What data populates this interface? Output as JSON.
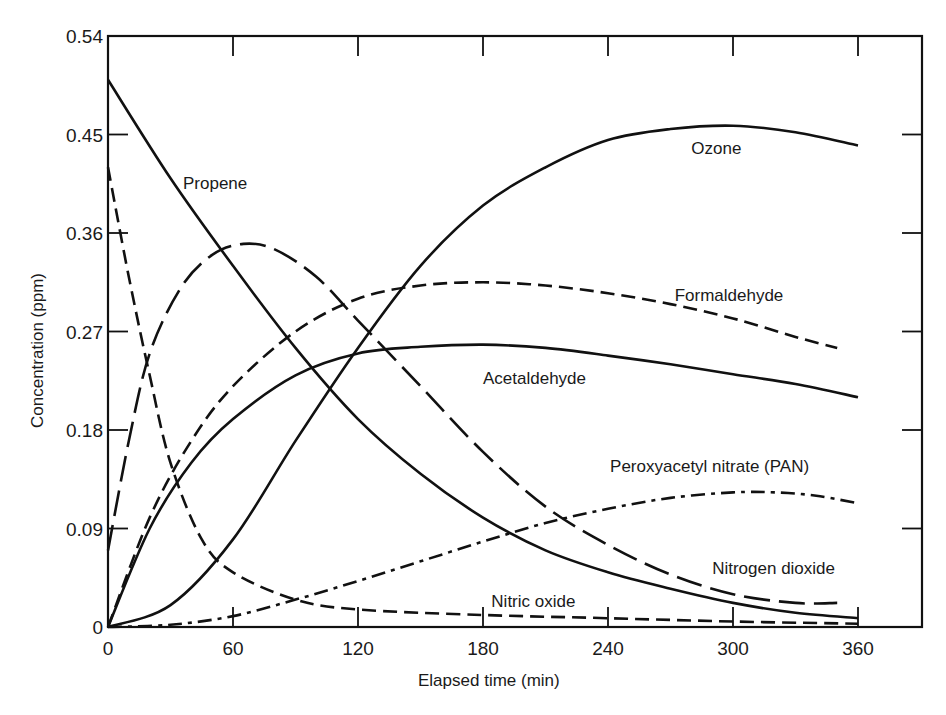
{
  "chart_data": {
    "type": "line",
    "title": "",
    "xlabel": "Elapsed time (min)",
    "ylabel": "Concentration (ppm)",
    "xlim": [
      0,
      360
    ],
    "ylim": [
      0,
      0.54
    ],
    "x_ticks": [
      0,
      60,
      120,
      180,
      240,
      300,
      360
    ],
    "x_tick_labels": [
      "0",
      "60",
      "120",
      "180",
      "240",
      "300",
      "360"
    ],
    "y_ticks": [
      0,
      0.09,
      0.18,
      0.27,
      0.36,
      0.45,
      0.54
    ],
    "y_tick_labels": [
      "0",
      "0.09",
      "0.18",
      "0.27",
      "0.36",
      "0.45",
      "0.54"
    ],
    "grid": false,
    "legend": "inline labels",
    "series": [
      {
        "name": "Propene",
        "style": "solid",
        "x": [
          0,
          30,
          60,
          90,
          120,
          150,
          180,
          210,
          240,
          270,
          300,
          330,
          360
        ],
        "values": [
          0.5,
          0.41,
          0.33,
          0.255,
          0.19,
          0.14,
          0.1,
          0.07,
          0.05,
          0.035,
          0.022,
          0.013,
          0.008
        ],
        "label_pos": [
          36,
          0.4
        ]
      },
      {
        "name": "Nitric oxide",
        "style": "dashed",
        "x": [
          0,
          10,
          20,
          30,
          45,
          60,
          90,
          120,
          180,
          240,
          300,
          360
        ],
        "values": [
          0.42,
          0.32,
          0.23,
          0.15,
          0.08,
          0.05,
          0.025,
          0.016,
          0.011,
          0.008,
          0.005,
          0.003
        ],
        "label_pos": [
          184,
          0.018
        ]
      },
      {
        "name": "Nitrogen dioxide",
        "style": "longdash",
        "x": [
          0,
          10,
          20,
          35,
          50,
          65,
          80,
          100,
          120,
          150,
          180,
          210,
          240,
          270,
          300,
          330,
          350
        ],
        "values": [
          0.07,
          0.17,
          0.25,
          0.31,
          0.34,
          0.35,
          0.345,
          0.32,
          0.28,
          0.22,
          0.16,
          0.11,
          0.075,
          0.048,
          0.03,
          0.022,
          0.022
        ],
        "label_pos": [
          290,
          0.048
        ]
      },
      {
        "name": "Ozone",
        "style": "solid",
        "x": [
          0,
          30,
          60,
          90,
          120,
          150,
          180,
          210,
          240,
          270,
          300,
          330,
          360
        ],
        "values": [
          0,
          0.02,
          0.08,
          0.17,
          0.255,
          0.33,
          0.385,
          0.42,
          0.445,
          0.455,
          0.458,
          0.452,
          0.44
        ],
        "label_pos": [
          280,
          0.432
        ]
      },
      {
        "name": "Formaldehyde",
        "style": "dashed",
        "x": [
          0,
          20,
          40,
          60,
          90,
          120,
          150,
          180,
          210,
          240,
          270,
          300,
          330,
          350
        ],
        "values": [
          0,
          0.1,
          0.17,
          0.22,
          0.27,
          0.3,
          0.312,
          0.315,
          0.312,
          0.305,
          0.295,
          0.282,
          0.265,
          0.255
        ],
        "label_pos": [
          272,
          0.298
        ]
      },
      {
        "name": "Acetaldehyde",
        "style": "solid",
        "x": [
          0,
          20,
          40,
          60,
          90,
          120,
          150,
          180,
          210,
          240,
          270,
          300,
          330,
          360
        ],
        "values": [
          0,
          0.09,
          0.15,
          0.19,
          0.23,
          0.25,
          0.256,
          0.258,
          0.255,
          0.248,
          0.24,
          0.231,
          0.222,
          0.21
        ],
        "label_pos": [
          180,
          0.222
        ]
      },
      {
        "name": "Peroxyacetyl nitrate (PAN)",
        "style": "dashdot",
        "x": [
          0,
          30,
          60,
          90,
          120,
          150,
          180,
          210,
          240,
          270,
          300,
          320,
          340,
          360
        ],
        "values": [
          0,
          0.002,
          0.01,
          0.025,
          0.042,
          0.06,
          0.078,
          0.095,
          0.108,
          0.118,
          0.123,
          0.123,
          0.12,
          0.113
        ],
        "label_pos": [
          241,
          0.142
        ]
      }
    ]
  },
  "axes": {
    "xlabel": "Elapsed time (min)",
    "ylabel": "Concentration (ppm)"
  },
  "labels": {
    "propene": "Propene",
    "nitric_oxide": "Nitric oxide",
    "nitrogen_dioxide": "Nitrogen dioxide",
    "ozone": "Ozone",
    "formaldehyde": "Formaldehyde",
    "acetaldehyde": "Acetaldehyde",
    "pan": "Peroxyacetyl nitrate (PAN)"
  }
}
